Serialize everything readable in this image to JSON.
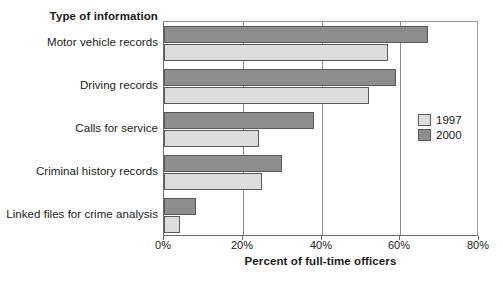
{
  "chart_data": {
    "type": "bar",
    "orientation": "horizontal",
    "title": "",
    "category_axis_title": "Type of information",
    "xlabel": "Percent of full-time officers",
    "ylabel": "",
    "xlim": [
      0,
      80
    ],
    "xticks": [
      "0%",
      "20%",
      "40%",
      "60%",
      "80%"
    ],
    "xtick_values": [
      0,
      20,
      40,
      60,
      80
    ],
    "grid": "vertical",
    "legend_position": "right",
    "categories": [
      "Motor vehicle records",
      "Driving records",
      "Calls for service",
      "Criminal history records",
      "Linked files for crime analysis"
    ],
    "series": [
      {
        "name": "1997",
        "color": "#dcdcdc",
        "values": [
          57,
          52,
          24,
          25,
          4
        ]
      },
      {
        "name": "2000",
        "color": "#8d8d8d",
        "values": [
          67,
          59,
          38,
          30,
          8
        ]
      }
    ]
  },
  "legend": {
    "entries": [
      {
        "label": "1997"
      },
      {
        "label": "2000"
      }
    ]
  },
  "colors": {
    "series_1997": "#dcdcdc",
    "series_2000": "#8d8d8d",
    "bar_outline": "#595959",
    "gridline": "#8c8c8c",
    "axis": "#6b6b6b",
    "text": "#1a1a1a",
    "background": "#ffffff"
  }
}
